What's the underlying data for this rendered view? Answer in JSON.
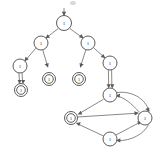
{
  "diagram": {
    "title": "",
    "type": "directed-graph-automaton",
    "colors": {
      "node_stroke": "#4a4a4a",
      "node_fill": "#ffffff",
      "edge": "#6a6a6a",
      "label": "#333333",
      "background": "#ffffff"
    },
    "nodes": [
      {
        "id": "n1",
        "label": "1",
        "x": 64,
        "y": 23,
        "r": 7.5,
        "accepting": false,
        "name": "node-root"
      },
      {
        "id": "n2",
        "label": "1",
        "x": 41,
        "y": 43,
        "r": 7.0,
        "accepting": false,
        "name": "node-left-branch"
      },
      {
        "id": "n3",
        "label": "1",
        "x": 88,
        "y": 43,
        "r": 7.0,
        "accepting": false,
        "name": "node-right-branch"
      },
      {
        "id": "n4",
        "label": "1",
        "x": 20,
        "y": 66,
        "r": 7.0,
        "accepting": false,
        "name": "node-left-inner"
      },
      {
        "id": "n5",
        "label": "1",
        "x": 49,
        "y": 79,
        "r": 6.5,
        "accepting": true,
        "name": "node-accept-a"
      },
      {
        "id": "n6",
        "label": "1",
        "x": 79,
        "y": 79,
        "r": 6.5,
        "accepting": true,
        "name": "node-accept-b"
      },
      {
        "id": "n7",
        "label": "1",
        "x": 110,
        "y": 63,
        "r": 7.0,
        "accepting": false,
        "name": "node-right-inner"
      },
      {
        "id": "n8",
        "label": "1",
        "x": 21,
        "y": 90,
        "r": 6.5,
        "accepting": true,
        "name": "node-accept-c"
      },
      {
        "id": "n9",
        "label": "1",
        "x": 110,
        "y": 95,
        "r": 7.0,
        "accepting": false,
        "name": "node-cycle-top"
      },
      {
        "id": "n10",
        "label": "1",
        "x": 71,
        "y": 118,
        "r": 6.5,
        "accepting": true,
        "name": "node-cycle-left-accept"
      },
      {
        "id": "n11",
        "label": "1",
        "x": 145,
        "y": 118,
        "r": 7.0,
        "accepting": false,
        "name": "node-cycle-right"
      },
      {
        "id": "n12",
        "label": "1",
        "x": 110,
        "y": 139,
        "r": 7.0,
        "accepting": false,
        "name": "node-cycle-bottom"
      }
    ],
    "edges": [
      {
        "from": "start",
        "to": "n1",
        "kind": "start-arrow",
        "name": "edge-start-to-root"
      },
      {
        "from": "n1",
        "to": "n2",
        "kind": "straight",
        "name": "edge-root-to-left"
      },
      {
        "from": "n1",
        "to": "n3",
        "kind": "straight",
        "name": "edge-root-to-right"
      },
      {
        "from": "n2",
        "to": "n4",
        "kind": "straight",
        "name": "edge-left-to-leftinner"
      },
      {
        "from": "n2",
        "to": "n5",
        "kind": "straight",
        "name": "edge-left-to-accept-a"
      },
      {
        "from": "n3",
        "to": "n6",
        "kind": "straight",
        "name": "edge-right-to-accept-b"
      },
      {
        "from": "n3",
        "to": "n7",
        "kind": "straight",
        "name": "edge-right-to-rightinner"
      },
      {
        "from": "n4",
        "to": "n8",
        "kind": "double-line",
        "name": "edge-leftinner-to-accept-c"
      },
      {
        "from": "n7",
        "to": "n9",
        "kind": "double-line",
        "name": "edge-rightinner-to-cycletop"
      },
      {
        "from": "n9",
        "to": "n10",
        "kind": "straight",
        "name": "edge-cycletop-to-cycleleft"
      },
      {
        "from": "n9",
        "to": "n11",
        "kind": "curve-right",
        "name": "edge-cycletop-to-cycleright"
      },
      {
        "from": "n10",
        "to": "n11",
        "kind": "straight",
        "name": "edge-cycleleft-to-cycleright"
      },
      {
        "from": "n11",
        "to": "n9",
        "kind": "curve-back",
        "name": "edge-cycleright-to-cycletop"
      },
      {
        "from": "n11",
        "to": "n12",
        "kind": "curve-down",
        "name": "edge-cycleright-to-cyclebottom"
      },
      {
        "from": "n12",
        "to": "n10",
        "kind": "straight",
        "name": "edge-cyclebottom-to-cycleleft"
      },
      {
        "from": "n12",
        "to": "n11",
        "kind": "curve-up",
        "name": "edge-cyclebottom-to-cycleright"
      }
    ],
    "artifacts": [
      {
        "name": "top-smudge",
        "x": 70,
        "y": 2,
        "w": 6,
        "h": 4
      }
    ]
  }
}
